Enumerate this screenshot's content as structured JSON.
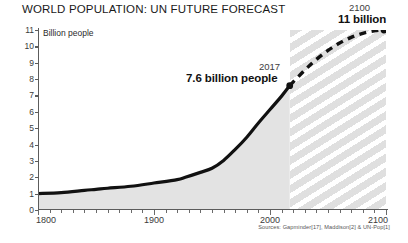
{
  "chart_data": {
    "type": "line",
    "title": "WORLD POPULATION: UN FUTURE FORECAST",
    "xlabel": "",
    "ylabel": "Billion people",
    "xlim": [
      1800,
      2100
    ],
    "ylim": [
      0,
      11
    ],
    "grid": false,
    "legend": "none",
    "y_ticks": [
      0,
      1,
      2,
      3,
      4,
      5,
      6,
      7,
      8,
      9,
      10,
      11
    ],
    "x_ticks_major": [
      1800,
      1900,
      2000,
      2100
    ],
    "x_tick_minor_step": 10,
    "forecast_start_year": 2017,
    "series": [
      {
        "name": "Historical population",
        "style": "solid",
        "fill": "light-gray-area",
        "x": [
          1800,
          1820,
          1840,
          1850,
          1860,
          1880,
          1900,
          1920,
          1927,
          1940,
          1950,
          1960,
          1970,
          1980,
          1990,
          2000,
          2010,
          2017
        ],
        "values": [
          1.0,
          1.06,
          1.2,
          1.26,
          1.33,
          1.45,
          1.65,
          1.86,
          2.0,
          2.3,
          2.55,
          3.03,
          3.7,
          4.45,
          5.32,
          6.14,
          6.96,
          7.6
        ]
      },
      {
        "name": "UN forecast",
        "style": "dashed",
        "x": [
          2017,
          2030,
          2040,
          2050,
          2060,
          2070,
          2080,
          2090,
          2100
        ],
        "values": [
          7.6,
          8.55,
          9.2,
          9.75,
          10.2,
          10.55,
          10.8,
          10.95,
          11.0
        ]
      }
    ],
    "annotations": [
      {
        "year": "2017",
        "value": "7.6 billion people",
        "point": [
          2017,
          7.6
        ]
      },
      {
        "year": "2100",
        "value": "11 billion",
        "point": [
          2100,
          11.0
        ]
      }
    ],
    "source": "Sources: Gapminder[17], Maddison[2] & UN-Pop[1]",
    "colors": {
      "line": "#111111",
      "axis": "#5c5c5c",
      "area_fill": "#e2e2e2",
      "forecast_hatch": "#9a9a9a",
      "text": "#1a1a1a",
      "background": "#ffffff"
    }
  }
}
